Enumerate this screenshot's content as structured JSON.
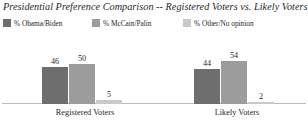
{
  "chart_data": {
    "type": "bar",
    "title": "Presidential Preference Comparison -- Registered Voters vs. Likely Voters",
    "xlabel": "",
    "ylabel": "",
    "ylim": [
      0,
      60
    ],
    "grid": false,
    "legend_position": "top-left",
    "categories": [
      "Registered Voters",
      "Likely Voters"
    ],
    "series": [
      {
        "name": "% Obama/Biden",
        "color": "#6e6e6e",
        "values": [
          46,
          50
        ]
      },
      {
        "name": "% McCain/Palin",
        "color": "#9c9c9c",
        "values": [
          50,
          54
        ]
      },
      {
        "name": "% Other/No opinion",
        "color": "#c9c9c9",
        "values": [
          5,
          2
        ]
      }
    ],
    "groups": [
      {
        "label": "Registered Voters",
        "bars": [
          {
            "series": "% Obama/Biden",
            "value": 46,
            "label": "46",
            "color": "#6e6e6e"
          },
          {
            "series": "% McCain/Palin",
            "value": 50,
            "label": "50",
            "color": "#9c9c9c"
          },
          {
            "series": "% Other/No opinion",
            "value": 5,
            "label": "5",
            "color": "#c9c9c9"
          }
        ]
      },
      {
        "label": "Likely Voters",
        "bars": [
          {
            "series": "% Obama/Biden",
            "value": 44,
            "label": "44",
            "color": "#6e6e6e"
          },
          {
            "series": "% McCain/Palin",
            "value": 54,
            "label": "54",
            "color": "#9c9c9c"
          },
          {
            "series": "% Other/No opinion",
            "value": 2,
            "label": "2",
            "color": "#c9c9c9"
          }
        ]
      }
    ]
  },
  "legend": {
    "items": [
      {
        "label": "% Obama/Biden",
        "color": "#6e6e6e"
      },
      {
        "label": "% McCain/Palin",
        "color": "#9c9c9c"
      },
      {
        "label": "% Other/No opinion",
        "color": "#c9c9c9"
      }
    ]
  },
  "axis": {
    "baseline_color": "#b9b9b9"
  }
}
